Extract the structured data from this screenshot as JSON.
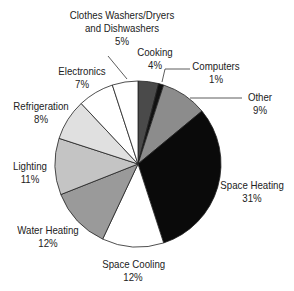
{
  "chart_data": {
    "type": "pie",
    "title": "",
    "start_angle_deg": 0,
    "direction": "clockwise",
    "slices": [
      {
        "label": "Cooking",
        "value": 4,
        "color": "#4a4a4a"
      },
      {
        "label": "Computers",
        "value": 1,
        "color": "#111111"
      },
      {
        "label": "Other",
        "value": 9,
        "color": "#8c8c8c"
      },
      {
        "label": "Space Heating",
        "value": 31,
        "color": "#0a0a0a"
      },
      {
        "label": "Space Cooling",
        "value": 12,
        "color": "#ffffff"
      },
      {
        "label": "Water Heating",
        "value": 12,
        "color": "#9a9a9a"
      },
      {
        "label": "Lighting",
        "value": 11,
        "color": "#c4c4c4"
      },
      {
        "label": "Refrigeration",
        "value": 8,
        "color": "#e0e0e0"
      },
      {
        "label": "Electronics",
        "value": 7,
        "color": "#ffffff"
      },
      {
        "label": "Clothes Washers/Dryers and Dishwashers",
        "value": 5,
        "color": "#ffffff"
      }
    ]
  },
  "labels": {
    "cooking": {
      "name": "Cooking",
      "pct": "4%"
    },
    "computers": {
      "name": "Computers",
      "pct": "1%"
    },
    "other": {
      "name": "Other",
      "pct": "9%"
    },
    "space_heating": {
      "name": "Space Heating",
      "pct": "31%"
    },
    "space_cooling": {
      "name": "Space Cooling",
      "pct": "12%"
    },
    "water_heating": {
      "name": "Water Heating",
      "pct": "12%"
    },
    "lighting": {
      "name": "Lighting",
      "pct": "11%"
    },
    "refrigeration": {
      "name": "Refrigeration",
      "pct": "8%"
    },
    "electronics": {
      "name": "Electronics",
      "pct": "7%"
    },
    "clothes": {
      "name1": "Clothes Washers/Dryers",
      "name2": "and Dishwashers",
      "pct": "5%"
    }
  }
}
